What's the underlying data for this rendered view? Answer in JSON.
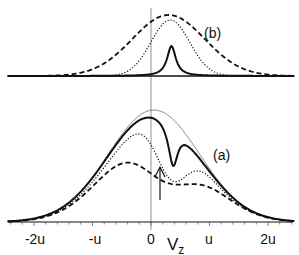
{
  "chart_data": [
    {
      "panel": "(b)",
      "type": "line",
      "title": "",
      "xlabel": "",
      "ylabel": "",
      "x_units": "u",
      "series": [
        {
          "name": "dashed",
          "style": "dashed",
          "shape": "broad gaussian",
          "center": 0.15,
          "width_u": 0.65,
          "peak_rel": 1.0
        },
        {
          "name": "dotted",
          "style": "dotted",
          "shape": "narrower peak",
          "center": 0.15,
          "width_u": 0.35,
          "peak_rel": 0.92
        },
        {
          "name": "solid",
          "style": "solid",
          "shape": "sharp lorentzian-like peak",
          "center": 0.15,
          "width_u": 0.08,
          "peak_rel": 0.45
        }
      ]
    },
    {
      "panel": "(a)",
      "type": "line",
      "title": "",
      "xlabel": "Vz",
      "ylabel": "",
      "xticks": [
        "-2u",
        "-u",
        "0",
        "u",
        "2u"
      ],
      "xlim": [
        -2.5,
        2.5
      ],
      "series": [
        {
          "name": "thin",
          "style": "thin solid",
          "shape": "gaussian envelope",
          "center": 0.0,
          "peak_rel": 1.0
        },
        {
          "name": "solid",
          "style": "solid",
          "shape": "gaussian with narrow dip",
          "dip_at": 0.15,
          "peak_rel": 0.97
        },
        {
          "name": "dotted",
          "style": "dotted",
          "shape": "gaussian with broader dip",
          "dip_at": 0.15,
          "peak_rel": 0.88
        },
        {
          "name": "dashed",
          "style": "dashed",
          "shape": "double-humped",
          "humps_at": [
            -0.5,
            0.8
          ],
          "peak_rel": 0.62
        }
      ],
      "annotations": [
        {
          "type": "arrow",
          "at_x": 0.15,
          "direction": "up"
        }
      ]
    }
  ],
  "figure": {
    "panel_b_label": "(b)",
    "panel_a_label": "(a)",
    "x_axis_label_main": "V",
    "x_axis_label_sub": "z",
    "xticks": [
      "-2u",
      "-u",
      "0",
      "u",
      "2u"
    ]
  }
}
